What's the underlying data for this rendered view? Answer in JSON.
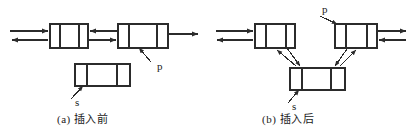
{
  "figure": {
    "stroke_color": "#2b2b2b",
    "fill_color": "#ffffff",
    "panels": [
      {
        "id": "a",
        "caption": "(a) 插入前",
        "pointer_labels": [
          {
            "name": "p",
            "text": "p"
          },
          {
            "name": "s",
            "text": "s"
          }
        ],
        "nodes": [
          {
            "name": "node-prev",
            "cells": 3
          },
          {
            "name": "node-p",
            "cells": 3
          },
          {
            "name": "node-s",
            "cells": 3
          }
        ]
      },
      {
        "id": "b",
        "caption": "(b) 插入后",
        "pointer_labels": [
          {
            "name": "p",
            "text": "p"
          },
          {
            "name": "s",
            "text": "s"
          }
        ],
        "nodes": [
          {
            "name": "node-prev",
            "cells": 3
          },
          {
            "name": "node-p",
            "cells": 3
          },
          {
            "name": "node-s",
            "cells": 3
          }
        ]
      }
    ]
  }
}
